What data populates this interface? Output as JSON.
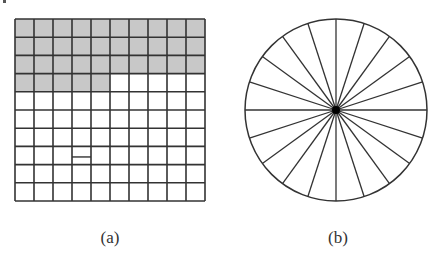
{
  "figure": {
    "panel_a": {
      "label": "(a)",
      "type": "grid",
      "rows": 10,
      "cols": 10,
      "shaded_cells": 35,
      "shaded_description": "first 3 full rows plus first 5 cells of row 4",
      "shade_color": "#c8c8c8",
      "line_color": "#333333",
      "extra_segment": {
        "row": 8,
        "col": 4
      }
    },
    "panel_b": {
      "label": "(b)",
      "type": "circle-sectors",
      "sectors": 20,
      "line_color": "#333333"
    }
  }
}
